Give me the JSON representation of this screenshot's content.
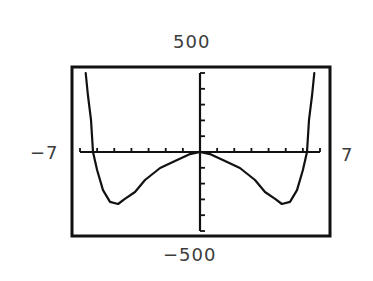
{
  "chart_data": {
    "type": "line",
    "title": "",
    "xlabel": "",
    "ylabel": "",
    "xlim": [
      -7,
      7
    ],
    "ylim": [
      -500,
      500
    ],
    "x_tick_step": 1,
    "y_tick_step": 100,
    "grid": false,
    "legend": null,
    "window_labels": {
      "ymax": "500",
      "ymin": "-500",
      "xmin": "-7",
      "xmax": "7"
    },
    "series": [
      {
        "name": "f(x)",
        "x": [
          -6.67,
          -6.54,
          -6.36,
          -6.24,
          -6.0,
          -5.66,
          -5.25,
          -4.78,
          -4.38,
          -3.79,
          -3.21,
          -2.33,
          -1.46,
          -0.58,
          0,
          0.58,
          1.46,
          2.33,
          3.21,
          3.79,
          4.38,
          4.78,
          5.25,
          5.66,
          6.0,
          6.24,
          6.36,
          6.54,
          6.67
        ],
        "y": [
          506,
          361,
          203,
          0,
          -114,
          -241,
          -316,
          -329,
          -297,
          -253,
          -177,
          -101,
          -57,
          -13,
          0,
          -13,
          -57,
          -101,
          -177,
          -253,
          -297,
          -329,
          -316,
          -241,
          -114,
          0,
          203,
          361,
          506
        ]
      }
    ],
    "features": {
      "roots": [
        -6.24,
        0,
        6.24
      ],
      "local_minima": [
        {
          "x": -4.9,
          "y": -330
        },
        {
          "x": 4.9,
          "y": -330
        }
      ],
      "symmetry": "even"
    }
  },
  "style": {
    "line_color": "#111111",
    "frame_color": "#111111",
    "background": "#ffffff"
  }
}
